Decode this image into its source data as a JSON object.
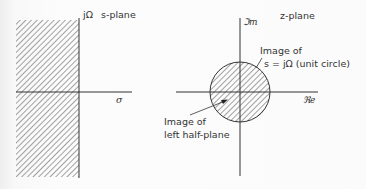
{
  "s_plane": {
    "title": "s-plane",
    "imag_axis_label": "jΩ",
    "real_axis_label": "σ",
    "shaded_region": "left half-plane"
  },
  "z_plane": {
    "title": "z-plane",
    "imag_axis_label": "ℑm",
    "real_axis_label": "ℜe",
    "annotation_unit_circle": {
      "line1": "Image of",
      "line2": "s = jΩ (unit circle)"
    },
    "annotation_interior": {
      "line1": "Image of",
      "line2": "left half-plane"
    },
    "shaded_region": "interior of unit circle"
  },
  "colors": {
    "ink": "#333333",
    "hatch": "#555555",
    "background": "#fafafa"
  }
}
